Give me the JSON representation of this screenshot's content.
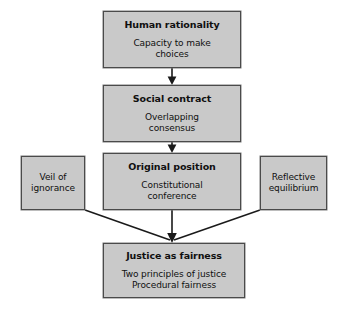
{
  "diagram": {
    "type": "flowchart",
    "colors": {
      "node_fill": "#c9c9c9",
      "node_border": "#4a4a4a",
      "connector": "#1a1a1a",
      "background": "#ffffff",
      "text": "#101010"
    },
    "nodes": [
      {
        "id": "human-rationality",
        "title": "Human rationality",
        "body_lines": [
          "Capacity to make",
          "choices"
        ]
      },
      {
        "id": "social-contract",
        "title": "Social contract",
        "body_lines": [
          "Overlapping",
          "consensus"
        ]
      },
      {
        "id": "original-position",
        "title": "Original position",
        "body_lines": [
          "Constitutional",
          "conference"
        ]
      },
      {
        "id": "veil-of-ignorance",
        "title": "",
        "body_lines": [
          "Veil of",
          "ignorance"
        ]
      },
      {
        "id": "reflective-equilibrium",
        "title": "",
        "body_lines": [
          "Reflective",
          "equilibrium"
        ]
      },
      {
        "id": "justice-as-fairness",
        "title": "Justice as fairness",
        "body_lines": [
          "Two principles of justice",
          "Procedural fairness"
        ]
      }
    ],
    "connectors": [
      {
        "id": "human-rationality-to-social-contract",
        "from": "human-rationality",
        "to": "social-contract",
        "style": "arrow-down"
      },
      {
        "id": "social-contract-to-original-position",
        "from": "social-contract",
        "to": "original-position",
        "style": "arrow-down"
      },
      {
        "id": "original-position-to-justice-as-fairness",
        "from": "original-position",
        "to": "justice-as-fairness",
        "style": "arrow-down"
      },
      {
        "id": "veil-of-ignorance-to-justice-as-fairness",
        "from": "veil-of-ignorance",
        "to": "justice-as-fairness",
        "style": "diagonal-line"
      },
      {
        "id": "reflective-equilibrium-to-justice-as-fairness",
        "from": "reflective-equilibrium",
        "to": "justice-as-fairness",
        "style": "diagonal-line"
      }
    ]
  }
}
